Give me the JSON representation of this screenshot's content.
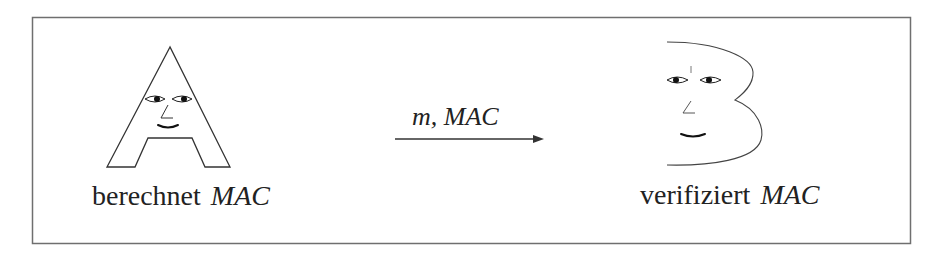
{
  "diagram": {
    "sender": {
      "name": "A",
      "label_text": "berechnet",
      "label_math": "MAC"
    },
    "receiver": {
      "name": "B",
      "label_text": "verifiziert",
      "label_math": "MAC"
    },
    "message": {
      "label": "m, MAC",
      "direction": "A-to-B"
    },
    "colors": {
      "stroke": "#333333",
      "frame": "#777777",
      "text": "#222222"
    }
  }
}
